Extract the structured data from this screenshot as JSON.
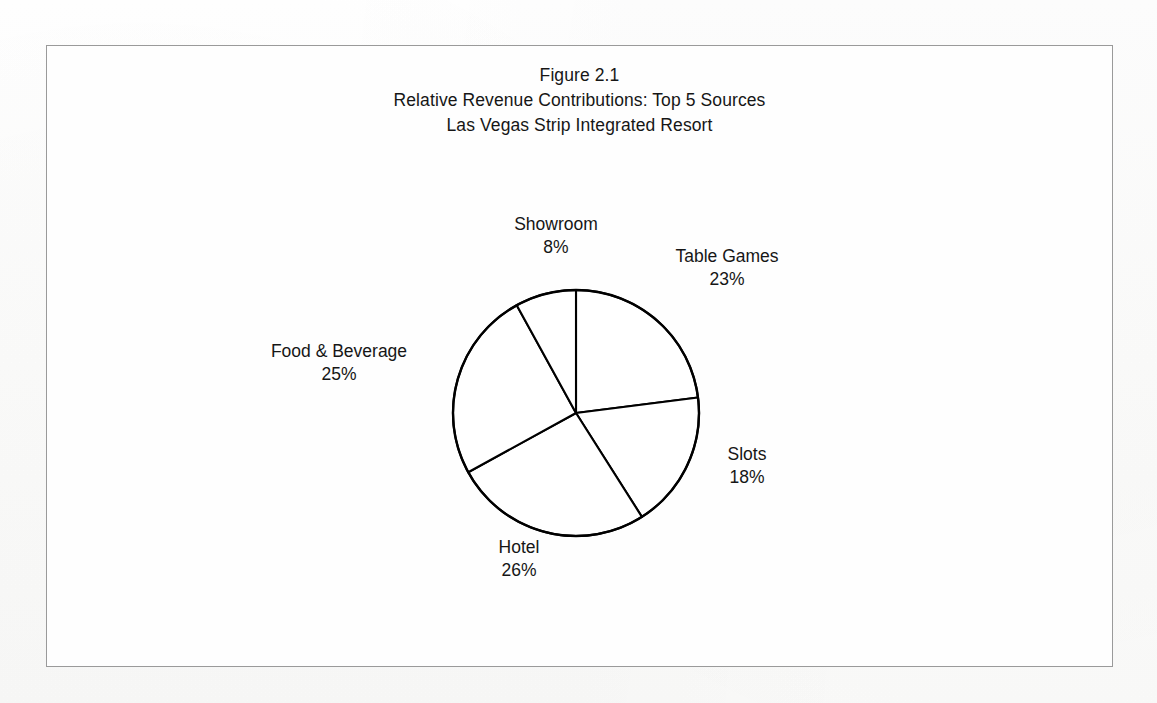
{
  "figure": {
    "title_lines": [
      "Figure 2.1",
      "Relative Revenue Contributions: Top 5 Sources",
      "Las Vegas Strip Integrated Resort"
    ],
    "border_color": "#9a9a9a",
    "background_color": "#fefefe"
  },
  "chart_data": {
    "type": "pie",
    "subtitle": "Las Vegas Strip Integrated Resort",
    "xlabel": "",
    "ylabel": "",
    "unit": "percent",
    "total": 100,
    "start_angle_deg": 0,
    "direction": "clockwise",
    "legend": "none",
    "grid": false,
    "slice_fill": "#ffffff",
    "slice_stroke": "#000000",
    "categories": [
      "Table Games",
      "Slots",
      "Hotel",
      "Food & Beverage",
      "Showroom"
    ],
    "values": [
      23,
      18,
      26,
      25,
      8
    ],
    "labels": [
      "23%",
      "18%",
      "26%",
      "25%",
      "8%"
    ],
    "slices": [
      {
        "name": "Table Games",
        "value": 23,
        "label": "23%",
        "start_deg": 0.0,
        "end_deg": 82.8
      },
      {
        "name": "Slots",
        "value": 18,
        "label": "18%",
        "start_deg": 82.8,
        "end_deg": 147.6
      },
      {
        "name": "Hotel",
        "value": 26,
        "label": "26%",
        "start_deg": 147.6,
        "end_deg": 241.2
      },
      {
        "name": "Food & Beverage",
        "value": 25,
        "label": "25%",
        "start_deg": 241.2,
        "end_deg": 331.2
      },
      {
        "name": "Showroom",
        "value": 8,
        "label": "8%",
        "start_deg": 331.2,
        "end_deg": 360.0
      }
    ]
  },
  "labels": {
    "showroom": {
      "name": "Showroom",
      "value": "8%"
    },
    "table_games": {
      "name": "Table Games",
      "value": "23%"
    },
    "food_beverage": {
      "name": "Food & Beverage",
      "value": "25%"
    },
    "slots": {
      "name": "Slots",
      "value": "18%"
    },
    "hotel": {
      "name": "Hotel",
      "value": "26%"
    }
  }
}
